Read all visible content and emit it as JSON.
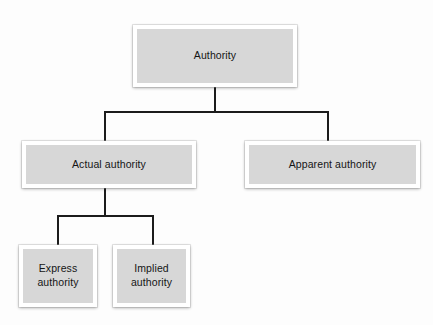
{
  "diagram": {
    "title": "Authority",
    "type": "hierarchy-tree",
    "orientation": "top-down",
    "background_color": "#fdfdfd",
    "node_fill_color": "#d7d7d7",
    "node_border_color": "#ffffff",
    "connector_color": "#1c1c1c",
    "text_color": "#151515",
    "nodes": [
      {
        "id": "authority",
        "label": "Authority",
        "level": 0
      },
      {
        "id": "actual-authority",
        "label": "Actual authority",
        "level": 1
      },
      {
        "id": "apparent-authority",
        "label": "Apparent authority",
        "level": 1
      },
      {
        "id": "express-authority",
        "label": "Express\nauthority",
        "level": 2
      },
      {
        "id": "implied-authority",
        "label": "Implied\nauthority",
        "level": 2
      }
    ],
    "edges": [
      {
        "from": "authority",
        "to": "actual-authority"
      },
      {
        "from": "authority",
        "to": "apparent-authority"
      },
      {
        "from": "actual-authority",
        "to": "express-authority"
      },
      {
        "from": "actual-authority",
        "to": "implied-authority"
      }
    ]
  }
}
